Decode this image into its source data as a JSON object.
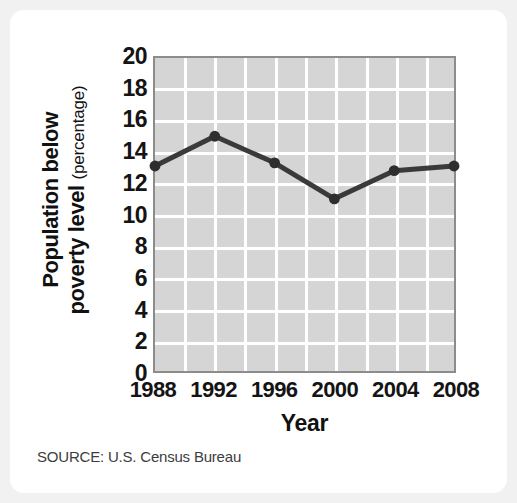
{
  "figure": {
    "source_note": "SOURCE: U.S. Census Bureau",
    "card_background": "#ffffff",
    "page_background": "#f1f1f1"
  },
  "chart_data": {
    "type": "line",
    "title": "",
    "xlabel": "Year",
    "ylabel": "Population below poverty level",
    "ylabel_line1": "Population below",
    "ylabel_line2": "poverty level",
    "ylabel_unit": "(percentage)",
    "categories": [
      "1988",
      "1992",
      "1996",
      "2000",
      "2004",
      "2008"
    ],
    "x": [
      1988,
      1992,
      1996,
      2000,
      2004,
      2008
    ],
    "values": [
      13.1,
      15.0,
      13.3,
      11.0,
      12.8,
      13.1
    ],
    "series": [
      {
        "name": "Population below poverty level",
        "values": [
          13.1,
          15.0,
          13.3,
          11.0,
          12.8,
          13.1
        ]
      }
    ],
    "ylim": [
      0,
      20
    ],
    "ytick_step": 2,
    "yticks": [
      0,
      2,
      4,
      6,
      8,
      10,
      12,
      14,
      16,
      18,
      20
    ],
    "ytick_labels": [
      "0",
      "2",
      "4",
      "6",
      "8",
      "10",
      "12",
      "14",
      "16",
      "18",
      "20"
    ],
    "xlim": [
      1988,
      2008
    ],
    "xticks": [
      1988,
      1992,
      1996,
      2000,
      2004,
      2008
    ],
    "xtick_labels": [
      "1988",
      "1992",
      "1996",
      "2000",
      "2004",
      "2008"
    ],
    "x_minor_step": 2,
    "grid": true,
    "grid_color": "#ffffff",
    "plot_background": "#d5d5d5",
    "plot_border_color": "#8c8c8c",
    "line_color": "#3a3a3a",
    "marker_color": "#2e2e2e",
    "legend": null,
    "legend_position": "none"
  }
}
